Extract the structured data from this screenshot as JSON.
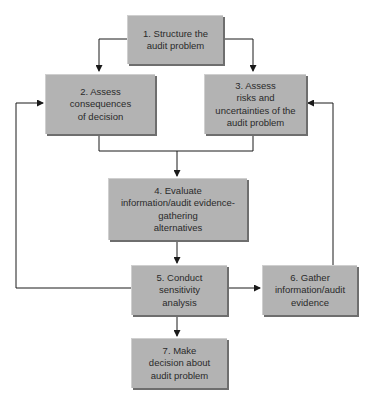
{
  "diagram": {
    "type": "flowchart",
    "nodes": [
      {
        "id": "n1",
        "label_lines": [
          "1. Structure the",
          "audit problem"
        ]
      },
      {
        "id": "n2",
        "label_lines": [
          "2. Assess",
          "consequences",
          "of decision"
        ]
      },
      {
        "id": "n3",
        "label_lines": [
          "3. Assess",
          "risks and",
          "uncertainties of the",
          "audit problem"
        ]
      },
      {
        "id": "n4",
        "label_lines": [
          "4. Evaluate",
          "information/audit evidence-",
          "gathering",
          "alternatives"
        ]
      },
      {
        "id": "n5",
        "label_lines": [
          "5. Conduct",
          "sensitivity",
          "analysis"
        ]
      },
      {
        "id": "n6",
        "label_lines": [
          "6. Gather",
          "information/audit",
          "evidence"
        ]
      },
      {
        "id": "n7",
        "label_lines": [
          "7. Make",
          "decision about",
          "audit problem"
        ]
      }
    ],
    "edges": [
      {
        "from": "n1",
        "to": "n2"
      },
      {
        "from": "n1",
        "to": "n3"
      },
      {
        "from": "n2",
        "to": "n4"
      },
      {
        "from": "n3",
        "to": "n4"
      },
      {
        "from": "n4",
        "to": "n5"
      },
      {
        "from": "n5",
        "to": "n6"
      },
      {
        "from": "n5",
        "to": "n7"
      },
      {
        "from": "n5",
        "to": "n2",
        "kind": "feedback"
      },
      {
        "from": "n6",
        "to": "n3",
        "kind": "feedback"
      }
    ],
    "colors": {
      "box_fill": "#b3b3b3",
      "box_shadow": "#6e6e6e",
      "line": "#1a1a1a",
      "text": "#2a2a2a"
    }
  }
}
